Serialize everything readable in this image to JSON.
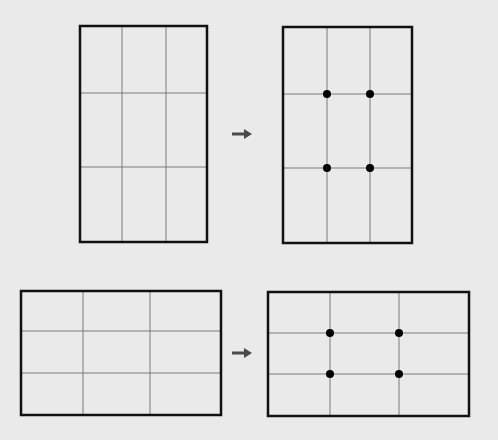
{
  "title": "Rule of thirds grid: intersection points",
  "colors": {
    "background": "#eaeaea",
    "frame": "#111111",
    "grid": "#7a7a7a",
    "dot": "#000000",
    "arrow": "#4a4a4a"
  },
  "rows": [
    {
      "orientation": "portrait",
      "before": {
        "x": 80,
        "y": 26,
        "w": 127,
        "h": 216,
        "vlines": [
          122,
          166
        ],
        "hlines": [
          93,
          167
        ],
        "dots": []
      },
      "arrow": {
        "x1": 232,
        "x2": 252,
        "y": 134,
        "icon": "arrow-right-icon"
      },
      "after": {
        "x": 283,
        "y": 27,
        "w": 129,
        "h": 216,
        "vlines": [
          327,
          370
        ],
        "hlines": [
          94,
          168
        ],
        "dots": [
          [
            327,
            94
          ],
          [
            370,
            94
          ],
          [
            327,
            168
          ],
          [
            370,
            168
          ]
        ]
      }
    },
    {
      "orientation": "landscape",
      "before": {
        "x": 21,
        "y": 291,
        "w": 200,
        "h": 124,
        "vlines": [
          83,
          150
        ],
        "hlines": [
          331,
          373
        ],
        "dots": []
      },
      "arrow": {
        "x1": 232,
        "x2": 252,
        "y": 353,
        "icon": "arrow-right-icon"
      },
      "after": {
        "x": 268,
        "y": 292,
        "w": 201,
        "h": 124,
        "vlines": [
          330,
          399
        ],
        "hlines": [
          333,
          374
        ],
        "dots": [
          [
            330,
            333
          ],
          [
            399,
            333
          ],
          [
            330,
            374
          ],
          [
            399,
            374
          ]
        ]
      }
    }
  ]
}
